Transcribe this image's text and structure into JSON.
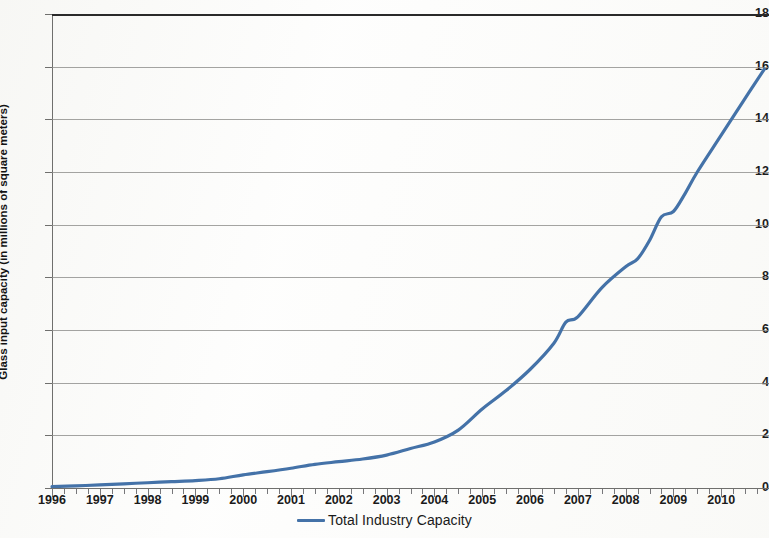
{
  "chart_data": {
    "type": "line",
    "title": "",
    "xlabel": "",
    "ylabel": "Glass input capacity (in millions of square meters)",
    "xlim": [
      1996,
      2011
    ],
    "ylim": [
      0,
      18
    ],
    "ytick_labels": [
      "0",
      "2",
      "4",
      "6",
      "8",
      "10",
      "12",
      "14",
      "16",
      "18"
    ],
    "ytick_values": [
      0,
      2,
      4,
      6,
      8,
      10,
      12,
      14,
      16,
      18
    ],
    "xtick_labels": [
      "1996",
      "1997",
      "1998",
      "1999",
      "2000",
      "2001",
      "2002",
      "2003",
      "2004",
      "2005",
      "2006",
      "2007",
      "2008",
      "2009",
      "2010"
    ],
    "xtick_values": [
      1996,
      1997,
      1998,
      1999,
      2000,
      2001,
      2002,
      2003,
      2004,
      2005,
      2006,
      2007,
      2008,
      2009,
      2010
    ],
    "minor_tick_interval": 0.25,
    "grid": "horizontal",
    "legend_position": "bottom-center",
    "series": [
      {
        "name": "Total Industry Capacity",
        "color": "#4472a8",
        "x": [
          1996.0,
          1996.5,
          1997.0,
          1997.5,
          1998.0,
          1998.5,
          1999.0,
          1999.5,
          2000.0,
          2000.5,
          2001.0,
          2001.5,
          2002.0,
          2002.5,
          2003.0,
          2003.5,
          2004.0,
          2004.5,
          2005.0,
          2005.5,
          2006.0,
          2006.5,
          2006.75,
          2007.0,
          2007.5,
          2008.0,
          2008.25,
          2008.5,
          2008.75,
          2009.0,
          2009.25,
          2009.5,
          2010.0,
          2010.5,
          2010.9
        ],
        "y": [
          0.05,
          0.08,
          0.12,
          0.16,
          0.2,
          0.24,
          0.28,
          0.35,
          0.5,
          0.62,
          0.75,
          0.9,
          1.0,
          1.1,
          1.25,
          1.5,
          1.75,
          2.2,
          3.0,
          3.7,
          4.5,
          5.5,
          6.3,
          6.5,
          7.6,
          8.4,
          8.7,
          9.4,
          10.3,
          10.5,
          11.2,
          12.0,
          13.4,
          14.8,
          15.9
        ]
      }
    ]
  },
  "legend": {
    "entries": [
      {
        "label": "Total Industry Capacity",
        "color": "#4472a8"
      }
    ]
  },
  "axes": {
    "y_axis_title": "Glass input capacity (in millions of square meters)"
  }
}
